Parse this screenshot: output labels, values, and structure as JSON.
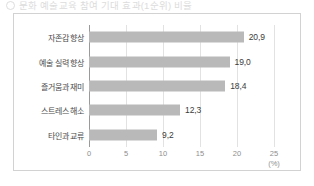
{
  "heading": {
    "bullet_icon": "circled-number-icon",
    "text": "문화 예술교육 참여 기대 효과(1순위) 비율"
  },
  "chart_data": {
    "type": "bar",
    "orientation": "horizontal",
    "title": "",
    "xlabel": "(%)",
    "ylabel": "",
    "xlim": [
      0,
      25
    ],
    "grid": true,
    "legend": null,
    "bar_color": "#b9b9b9",
    "decimal_separator": ",",
    "categories": [
      "자존감 향상",
      "예술 실력 향상",
      "즐거움과 재미",
      "스트레스 해소",
      "타인과 교류"
    ],
    "values": [
      20.9,
      19.0,
      18.4,
      12.3,
      9.2
    ],
    "value_labels": [
      "20,9",
      "19,0",
      "18,4",
      "12,3",
      "9,2"
    ],
    "xticks": [
      0,
      5,
      10,
      15,
      20,
      25
    ],
    "xtick_labels": [
      "0",
      "5",
      "10",
      "15",
      "20",
      "25"
    ]
  }
}
